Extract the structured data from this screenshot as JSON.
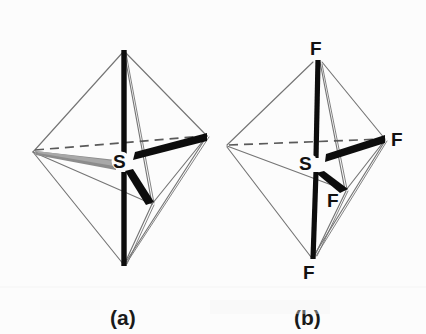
{
  "figure": {
    "background_color": "#fcfcfc",
    "edge_color": "#757575",
    "bond_color": "#0d0d0d",
    "wedge_gray_color": "#8c8c8c",
    "label_color": "#111111",
    "width": 426,
    "height": 334
  },
  "panels": [
    {
      "id": "panel-a",
      "caption": "(a)",
      "caption_x": 122,
      "caption_y": 325,
      "description": "Trigonal bipyramid with central atom S and unlabeled bonds",
      "center_label": "S",
      "center_label_x": 120,
      "center_label_y": 168,
      "vertices": {
        "apex_top": [
          124,
          50
        ],
        "apex_bottom": [
          124,
          266
        ],
        "equatorial_left": [
          33,
          152
        ],
        "equatorial_right": [
          207,
          136
        ],
        "equatorial_front": [
          152,
          204
        ],
        "center": [
          124,
          160
        ]
      },
      "atom_labels": []
    },
    {
      "id": "panel-b",
      "caption": "(b)",
      "caption_x": 306,
      "caption_y": 325,
      "description": "Trigonal bipyramid with central atom S and four fluorine atoms labeled F",
      "center_label": "S",
      "center_label_x": 306,
      "center_label_y": 170,
      "vertices": {
        "apex_top": [
          318,
          60
        ],
        "apex_bottom": [
          313,
          258
        ],
        "equatorial_left": [
          227,
          145
        ],
        "equatorial_right": [
          385,
          139
        ],
        "equatorial_front": [
          345,
          190
        ],
        "center": [
          316,
          158
        ]
      },
      "atom_labels": [
        {
          "text": "F",
          "x": 311,
          "y": 54,
          "position": "top"
        },
        {
          "text": "F",
          "x": 392,
          "y": 140,
          "position": "right"
        },
        {
          "text": "F",
          "x": 330,
          "y": 207,
          "position": "front"
        },
        {
          "text": "F",
          "x": 306,
          "y": 278,
          "position": "bottom"
        }
      ]
    }
  ]
}
